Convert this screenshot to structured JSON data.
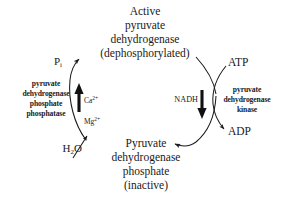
{
  "figure": {
    "stroke_color": "#1a1a1a",
    "background_color": "#ffffff"
  },
  "states": {
    "active": "Active\npyruvate\ndehydrogenase\n(dephosphorylated)",
    "inactive": "Pyruvate\ndehydrogenase\nphosphate\n(inactive)"
  },
  "enzymes": {
    "phosphatase": "pyruvate\ndehydrogenase\nphosphate\nphosphatase",
    "kinase": "pyruvate\ndehydrogenase\nkinase"
  },
  "cofactors": {
    "ions_line1": "Ca",
    "ions_charge1": "2+",
    "ions_line2": "Mg",
    "ions_charge2": "2+",
    "nadh": "NADH"
  },
  "substrates": {
    "pi_symbol": "P",
    "pi_subscript": "i",
    "water_pre": "H",
    "water_subscript": "2",
    "water_post": "O",
    "atp": "ATP",
    "adp": "ADP"
  }
}
